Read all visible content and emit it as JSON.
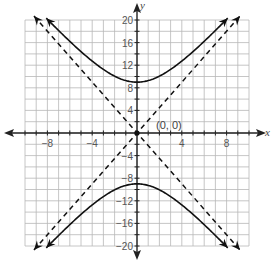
{
  "chart_data": {
    "type": "line",
    "title": "",
    "xlabel": "x",
    "ylabel": "y",
    "xlim": [
      -10,
      10
    ],
    "ylim": [
      -20,
      20
    ],
    "grid": true,
    "x_grid_step": 1,
    "y_grid_step": 2,
    "x_tick_labels": [
      "-8",
      "-4",
      "4",
      "8"
    ],
    "x_ticks": [
      -8,
      -4,
      4,
      8
    ],
    "y_tick_labels": [
      "20",
      "16",
      "12",
      "8",
      "4",
      "4",
      "8",
      "12",
      "16",
      "20"
    ],
    "y_ticks": [
      20,
      16,
      12,
      8,
      4,
      -4,
      -8,
      -12,
      -16,
      -20
    ],
    "y_tick_display": [
      "20",
      "16",
      "12",
      "8",
      "4",
      "−4",
      "−8",
      "−12",
      "−16",
      "−20"
    ],
    "series": [
      {
        "name": "hyperbola upper branch",
        "style": "solid",
        "equation": "y^2/81 - x^2/16 = 1, y>0",
        "x": [
          -8.1,
          -6,
          -4,
          -2,
          0,
          2,
          4,
          6,
          8.1
        ],
        "y": [
          20,
          16.2,
          12.7,
          9.9,
          9,
          9.9,
          12.7,
          16.2,
          20
        ]
      },
      {
        "name": "hyperbola lower branch",
        "style": "solid",
        "equation": "y^2/81 - x^2/16 = 1, y<0",
        "x": [
          -8.1,
          -6,
          -4,
          -2,
          0,
          2,
          4,
          6,
          8.1
        ],
        "y": [
          -20,
          -16.2,
          -12.7,
          -9.9,
          -9,
          -9.9,
          -12.7,
          -16.2,
          -20
        ]
      },
      {
        "name": "asymptote y = 9/4 x",
        "style": "dashed",
        "x": [
          -9.2,
          9.2
        ],
        "y": [
          -20.7,
          20.7
        ]
      },
      {
        "name": "asymptote y = -9/4 x",
        "style": "dashed",
        "x": [
          -9.2,
          9.2
        ],
        "y": [
          20.7,
          -20.7
        ]
      }
    ],
    "annotations": [
      {
        "text": "(0, 0)",
        "x": 0,
        "y": 0
      }
    ]
  },
  "labels": {
    "x_axis": "x",
    "y_axis": "y",
    "origin": "(0, 0)"
  }
}
